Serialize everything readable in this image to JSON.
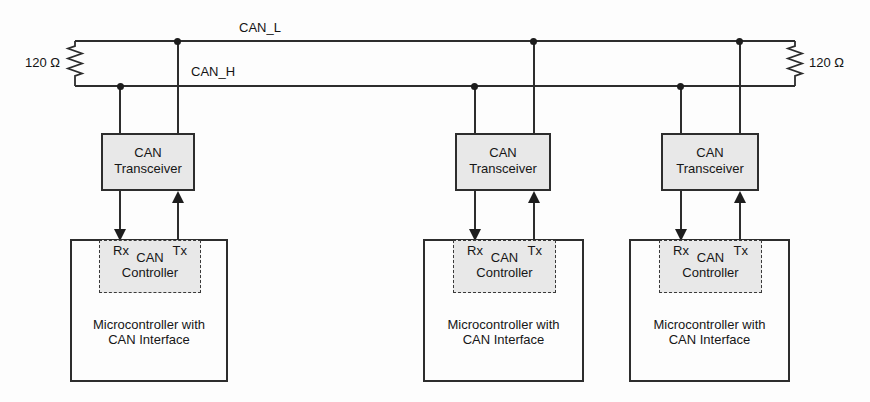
{
  "diagram_title": "CAN bus network",
  "colors": {
    "line": "#2d2d2d",
    "text": "#141414",
    "box_fill": "#e8e8e8",
    "background": "#fdfdfd"
  },
  "bus": {
    "can_l_label": "CAN_L",
    "can_h_label": "CAN_H"
  },
  "terminators": {
    "left_label": "120 Ω",
    "right_label": "120 Ω"
  },
  "nodes": [
    {
      "transceiver": {
        "line1": "CAN",
        "line2": "Transceiver"
      },
      "controller": {
        "rx": "Rx",
        "tx": "Tx",
        "line1": "CAN",
        "line2": "Controller"
      },
      "mcu": {
        "line1": "Microcontroller with",
        "line2": "CAN Interface"
      }
    },
    {
      "transceiver": {
        "line1": "CAN",
        "line2": "Transceiver"
      },
      "controller": {
        "rx": "Rx",
        "tx": "Tx",
        "line1": "CAN",
        "line2": "Controller"
      },
      "mcu": {
        "line1": "Microcontroller with",
        "line2": "CAN Interface"
      }
    },
    {
      "transceiver": {
        "line1": "CAN",
        "line2": "Transceiver"
      },
      "controller": {
        "rx": "Rx",
        "tx": "Tx",
        "line1": "CAN",
        "line2": "Controller"
      },
      "mcu": {
        "line1": "Microcontroller with",
        "line2": "CAN Interface"
      }
    }
  ]
}
